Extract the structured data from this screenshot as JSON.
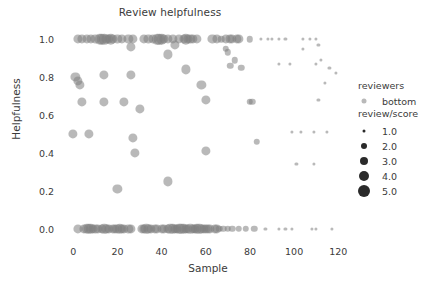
{
  "chart_data": {
    "type": "scatter",
    "title": "Review helpfulness",
    "xlabel": "Sample",
    "ylabel": "Helpfulness",
    "xlim": [
      -6,
      128
    ],
    "ylim": [
      -0.07,
      1.08
    ],
    "xticks": [
      0,
      20,
      40,
      60,
      80,
      100,
      120
    ],
    "xtick_labels": [
      "0",
      "20",
      "40",
      "60",
      "80",
      "100",
      "120"
    ],
    "yticks": [
      0.0,
      0.2,
      0.4,
      0.6,
      0.8,
      1.0
    ],
    "ytick_labels": [
      "0.0",
      "0.2",
      "0.4",
      "0.6",
      "0.8",
      "1.0"
    ],
    "grid": false,
    "legend_position": "right",
    "marker_color": "#7f7f7f",
    "marker_opacity": 0.55,
    "size_key": "review/score",
    "hue_key": "reviewers",
    "hue_values": [
      "bottom"
    ],
    "points": [
      {
        "x": 2,
        "y": 1.0,
        "s": 3
      },
      {
        "x": 4,
        "y": 1.0,
        "s": 3
      },
      {
        "x": 6,
        "y": 1.0,
        "s": 3
      },
      {
        "x": 8,
        "y": 1.0,
        "s": 3
      },
      {
        "x": 10,
        "y": 1.0,
        "s": 3
      },
      {
        "x": 12,
        "y": 1.0,
        "s": 4
      },
      {
        "x": 13,
        "y": 1.0,
        "s": 4
      },
      {
        "x": 14,
        "y": 1.0,
        "s": 4
      },
      {
        "x": 15,
        "y": 1.0,
        "s": 3
      },
      {
        "x": 16,
        "y": 1.0,
        "s": 3
      },
      {
        "x": 17,
        "y": 1.0,
        "s": 4
      },
      {
        "x": 18,
        "y": 1.0,
        "s": 3
      },
      {
        "x": 20,
        "y": 1.0,
        "s": 3
      },
      {
        "x": 22,
        "y": 1.0,
        "s": 3
      },
      {
        "x": 25,
        "y": 1.0,
        "s": 3
      },
      {
        "x": 27,
        "y": 1.0,
        "s": 3
      },
      {
        "x": 32,
        "y": 1.0,
        "s": 3
      },
      {
        "x": 34,
        "y": 1.0,
        "s": 3
      },
      {
        "x": 36,
        "y": 1.0,
        "s": 3
      },
      {
        "x": 38,
        "y": 1.0,
        "s": 4
      },
      {
        "x": 39,
        "y": 1.0,
        "s": 4
      },
      {
        "x": 40,
        "y": 1.0,
        "s": 4
      },
      {
        "x": 41,
        "y": 1.0,
        "s": 3
      },
      {
        "x": 43,
        "y": 1.0,
        "s": 3
      },
      {
        "x": 45,
        "y": 1.0,
        "s": 3
      },
      {
        "x": 48,
        "y": 1.0,
        "s": 3
      },
      {
        "x": 50,
        "y": 1.0,
        "s": 3
      },
      {
        "x": 51,
        "y": 1.0,
        "s": 4
      },
      {
        "x": 52,
        "y": 1.0,
        "s": 3
      },
      {
        "x": 53,
        "y": 1.0,
        "s": 3
      },
      {
        "x": 54,
        "y": 1.0,
        "s": 3
      },
      {
        "x": 56,
        "y": 1.0,
        "s": 3
      },
      {
        "x": 63,
        "y": 1.0,
        "s": 3
      },
      {
        "x": 65,
        "y": 1.0,
        "s": 3
      },
      {
        "x": 67,
        "y": 1.0,
        "s": 2
      },
      {
        "x": 69,
        "y": 1.0,
        "s": 3
      },
      {
        "x": 71,
        "y": 1.0,
        "s": 3
      },
      {
        "x": 72,
        "y": 1.0,
        "s": 3
      },
      {
        "x": 74,
        "y": 1.0,
        "s": 3
      },
      {
        "x": 75,
        "y": 1.0,
        "s": 3
      },
      {
        "x": 80,
        "y": 1.0,
        "s": 2
      },
      {
        "x": 85,
        "y": 1.0,
        "s": 1
      },
      {
        "x": 88,
        "y": 1.0,
        "s": 1
      },
      {
        "x": 90,
        "y": 1.0,
        "s": 1
      },
      {
        "x": 93,
        "y": 1.0,
        "s": 1
      },
      {
        "x": 96,
        "y": 1.0,
        "s": 1
      },
      {
        "x": 104,
        "y": 1.0,
        "s": 1
      },
      {
        "x": 107,
        "y": 1.0,
        "s": 1
      },
      {
        "x": 110,
        "y": 1.0,
        "s": 1
      },
      {
        "x": 26,
        "y": 0.96,
        "s": 3
      },
      {
        "x": 46,
        "y": 0.97,
        "s": 3
      },
      {
        "x": 69,
        "y": 0.95,
        "s": 2
      },
      {
        "x": 70,
        "y": 0.93,
        "s": 2
      },
      {
        "x": 104,
        "y": 0.95,
        "s": 1
      },
      {
        "x": 111,
        "y": 0.97,
        "s": 1
      },
      {
        "x": 43,
        "y": 0.92,
        "s": 3
      },
      {
        "x": 73,
        "y": 0.89,
        "s": 2
      },
      {
        "x": 112,
        "y": 0.89,
        "s": 1
      },
      {
        "x": 51,
        "y": 0.84,
        "s": 3
      },
      {
        "x": 71,
        "y": 0.86,
        "s": 2
      },
      {
        "x": 76,
        "y": 0.85,
        "s": 2
      },
      {
        "x": 93,
        "y": 0.87,
        "s": 1
      },
      {
        "x": 98,
        "y": 0.87,
        "s": 1
      },
      {
        "x": 110,
        "y": 0.87,
        "s": 1
      },
      {
        "x": 116,
        "y": 0.85,
        "s": 1
      },
      {
        "x": 119,
        "y": 0.82,
        "s": 1
      },
      {
        "x": 1,
        "y": 0.8,
        "s": 3
      },
      {
        "x": 2,
        "y": 0.78,
        "s": 3
      },
      {
        "x": 3,
        "y": 0.76,
        "s": 3
      },
      {
        "x": 14,
        "y": 0.81,
        "s": 3
      },
      {
        "x": 26,
        "y": 0.81,
        "s": 3
      },
      {
        "x": 114,
        "y": 0.77,
        "s": 1
      },
      {
        "x": 58,
        "y": 0.76,
        "s": 3
      },
      {
        "x": 4,
        "y": 0.67,
        "s": 3
      },
      {
        "x": 14,
        "y": 0.67,
        "s": 3
      },
      {
        "x": 23,
        "y": 0.67,
        "s": 3
      },
      {
        "x": 60,
        "y": 0.68,
        "s": 3
      },
      {
        "x": 80,
        "y": 0.67,
        "s": 2
      },
      {
        "x": 81,
        "y": 0.67,
        "s": 2
      },
      {
        "x": 111,
        "y": 0.68,
        "s": 1
      },
      {
        "x": 30,
        "y": 0.63,
        "s": 3
      },
      {
        "x": 0,
        "y": 0.5,
        "s": 3
      },
      {
        "x": 7,
        "y": 0.5,
        "s": 3
      },
      {
        "x": 99,
        "y": 0.51,
        "s": 1
      },
      {
        "x": 103,
        "y": 0.51,
        "s": 1
      },
      {
        "x": 109,
        "y": 0.51,
        "s": 1
      },
      {
        "x": 115,
        "y": 0.51,
        "s": 1
      },
      {
        "x": 27,
        "y": 0.48,
        "s": 3
      },
      {
        "x": 83,
        "y": 0.46,
        "s": 2
      },
      {
        "x": 28,
        "y": 0.4,
        "s": 3
      },
      {
        "x": 60,
        "y": 0.41,
        "s": 3
      },
      {
        "x": 101,
        "y": 0.34,
        "s": 1
      },
      {
        "x": 109,
        "y": 0.34,
        "s": 1
      },
      {
        "x": 43,
        "y": 0.25,
        "s": 3
      },
      {
        "x": 20,
        "y": 0.21,
        "s": 3
      },
      {
        "x": 2,
        "y": 0.0,
        "s": 3
      },
      {
        "x": 5,
        "y": 0.0,
        "s": 3
      },
      {
        "x": 6,
        "y": 0.0,
        "s": 4
      },
      {
        "x": 7,
        "y": 0.0,
        "s": 4
      },
      {
        "x": 8,
        "y": 0.0,
        "s": 4
      },
      {
        "x": 9,
        "y": 0.0,
        "s": 3
      },
      {
        "x": 10,
        "y": 0.0,
        "s": 3
      },
      {
        "x": 11,
        "y": 0.0,
        "s": 3
      },
      {
        "x": 13,
        "y": 0.0,
        "s": 3
      },
      {
        "x": 14,
        "y": 0.0,
        "s": 4
      },
      {
        "x": 15,
        "y": 0.0,
        "s": 3
      },
      {
        "x": 16,
        "y": 0.0,
        "s": 3
      },
      {
        "x": 18,
        "y": 0.0,
        "s": 3
      },
      {
        "x": 19,
        "y": 0.0,
        "s": 3
      },
      {
        "x": 20,
        "y": 0.0,
        "s": 3
      },
      {
        "x": 21,
        "y": 0.0,
        "s": 4
      },
      {
        "x": 22,
        "y": 0.0,
        "s": 3
      },
      {
        "x": 23,
        "y": 0.0,
        "s": 3
      },
      {
        "x": 25,
        "y": 0.0,
        "s": 3
      },
      {
        "x": 26,
        "y": 0.0,
        "s": 3
      },
      {
        "x": 31,
        "y": 0.0,
        "s": 3
      },
      {
        "x": 32,
        "y": 0.0,
        "s": 3
      },
      {
        "x": 33,
        "y": 0.0,
        "s": 4
      },
      {
        "x": 34,
        "y": 0.0,
        "s": 3
      },
      {
        "x": 35,
        "y": 0.0,
        "s": 3
      },
      {
        "x": 37,
        "y": 0.0,
        "s": 3
      },
      {
        "x": 38,
        "y": 0.0,
        "s": 3
      },
      {
        "x": 40,
        "y": 0.0,
        "s": 3
      },
      {
        "x": 41,
        "y": 0.0,
        "s": 3
      },
      {
        "x": 43,
        "y": 0.0,
        "s": 3
      },
      {
        "x": 44,
        "y": 0.0,
        "s": 4
      },
      {
        "x": 45,
        "y": 0.0,
        "s": 4
      },
      {
        "x": 46,
        "y": 0.0,
        "s": 3
      },
      {
        "x": 47,
        "y": 0.0,
        "s": 3
      },
      {
        "x": 48,
        "y": 0.0,
        "s": 4
      },
      {
        "x": 49,
        "y": 0.0,
        "s": 4
      },
      {
        "x": 50,
        "y": 0.0,
        "s": 4
      },
      {
        "x": 51,
        "y": 0.0,
        "s": 3
      },
      {
        "x": 52,
        "y": 0.0,
        "s": 3
      },
      {
        "x": 53,
        "y": 0.0,
        "s": 4
      },
      {
        "x": 54,
        "y": 0.0,
        "s": 3
      },
      {
        "x": 55,
        "y": 0.0,
        "s": 3
      },
      {
        "x": 56,
        "y": 0.0,
        "s": 4
      },
      {
        "x": 57,
        "y": 0.0,
        "s": 4
      },
      {
        "x": 58,
        "y": 0.0,
        "s": 3
      },
      {
        "x": 59,
        "y": 0.0,
        "s": 3
      },
      {
        "x": 60,
        "y": 0.0,
        "s": 3
      },
      {
        "x": 61,
        "y": 0.0,
        "s": 3
      },
      {
        "x": 62,
        "y": 0.0,
        "s": 3
      },
      {
        "x": 64,
        "y": 0.0,
        "s": 3
      },
      {
        "x": 65,
        "y": 0.0,
        "s": 3
      },
      {
        "x": 66,
        "y": 0.0,
        "s": 2
      },
      {
        "x": 68,
        "y": 0.0,
        "s": 2
      },
      {
        "x": 70,
        "y": 0.0,
        "s": 2
      },
      {
        "x": 72,
        "y": 0.0,
        "s": 2
      },
      {
        "x": 75,
        "y": 0.0,
        "s": 2
      },
      {
        "x": 78,
        "y": 0.0,
        "s": 2
      },
      {
        "x": 82,
        "y": 0.0,
        "s": 2
      },
      {
        "x": 87,
        "y": 0.0,
        "s": 1
      },
      {
        "x": 93,
        "y": 0.0,
        "s": 1
      },
      {
        "x": 96,
        "y": 0.0,
        "s": 1
      },
      {
        "x": 99,
        "y": 0.0,
        "s": 1
      },
      {
        "x": 108,
        "y": 0.0,
        "s": 1
      },
      {
        "x": 110,
        "y": 0.0,
        "s": 1
      },
      {
        "x": 117,
        "y": 0.0,
        "s": 1
      }
    ]
  },
  "legend": {
    "hue_title": "reviewers",
    "hue_entries": [
      {
        "label": "bottom",
        "diameter": 5,
        "color": "#b9b9b9"
      }
    ],
    "size_title": "review/score",
    "size_entries": [
      {
        "label": "1.0",
        "diameter": 3,
        "color": "#2a2a2a"
      },
      {
        "label": "2.0",
        "diameter": 6,
        "color": "#2a2a2a"
      },
      {
        "label": "3.0",
        "diameter": 8,
        "color": "#2a2a2a"
      },
      {
        "label": "4.0",
        "diameter": 10,
        "color": "#2a2a2a"
      },
      {
        "label": "5.0",
        "diameter": 12,
        "color": "#2a2a2a"
      }
    ]
  }
}
